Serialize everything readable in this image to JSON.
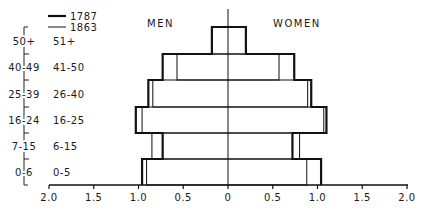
{
  "chart_data": {
    "type": "bar",
    "subtype": "population-pyramid",
    "title": "",
    "xlabel": "",
    "ylabel": "",
    "side_labels": {
      "left": "MEN",
      "right": "WOMEN"
    },
    "x_ticks": [
      "2.0",
      "1.5",
      "1.0",
      "0.5",
      "0",
      "0.5",
      "1.0",
      "1.5",
      "2.0"
    ],
    "xlim": [
      -2.0,
      2.0
    ],
    "grid": false,
    "legend": [
      {
        "name": "1787",
        "style": "thick"
      },
      {
        "name": "1863",
        "style": "thin"
      }
    ],
    "legend_position": "top-left",
    "categories_1787": [
      "50+",
      "40-49",
      "25-39",
      "16-24",
      "7-15",
      "0-6"
    ],
    "categories_1863": [
      "51+",
      "41-50",
      "26-40",
      "16-25",
      "6-15",
      "0-5"
    ],
    "series": [
      {
        "name": "1787",
        "sex": "men",
        "values": [
          0.18,
          0.73,
          0.89,
          1.03,
          0.73,
          0.96
        ]
      },
      {
        "name": "1787",
        "sex": "women",
        "values": [
          0.2,
          0.74,
          0.93,
          1.1,
          0.72,
          1.04
        ]
      },
      {
        "name": "1863",
        "sex": "men",
        "values": [
          0.18,
          0.57,
          0.84,
          0.96,
          0.85,
          0.91
        ]
      },
      {
        "name": "1863",
        "sex": "women",
        "values": [
          0.2,
          0.57,
          0.89,
          1.07,
          0.8,
          0.88
        ]
      }
    ]
  }
}
